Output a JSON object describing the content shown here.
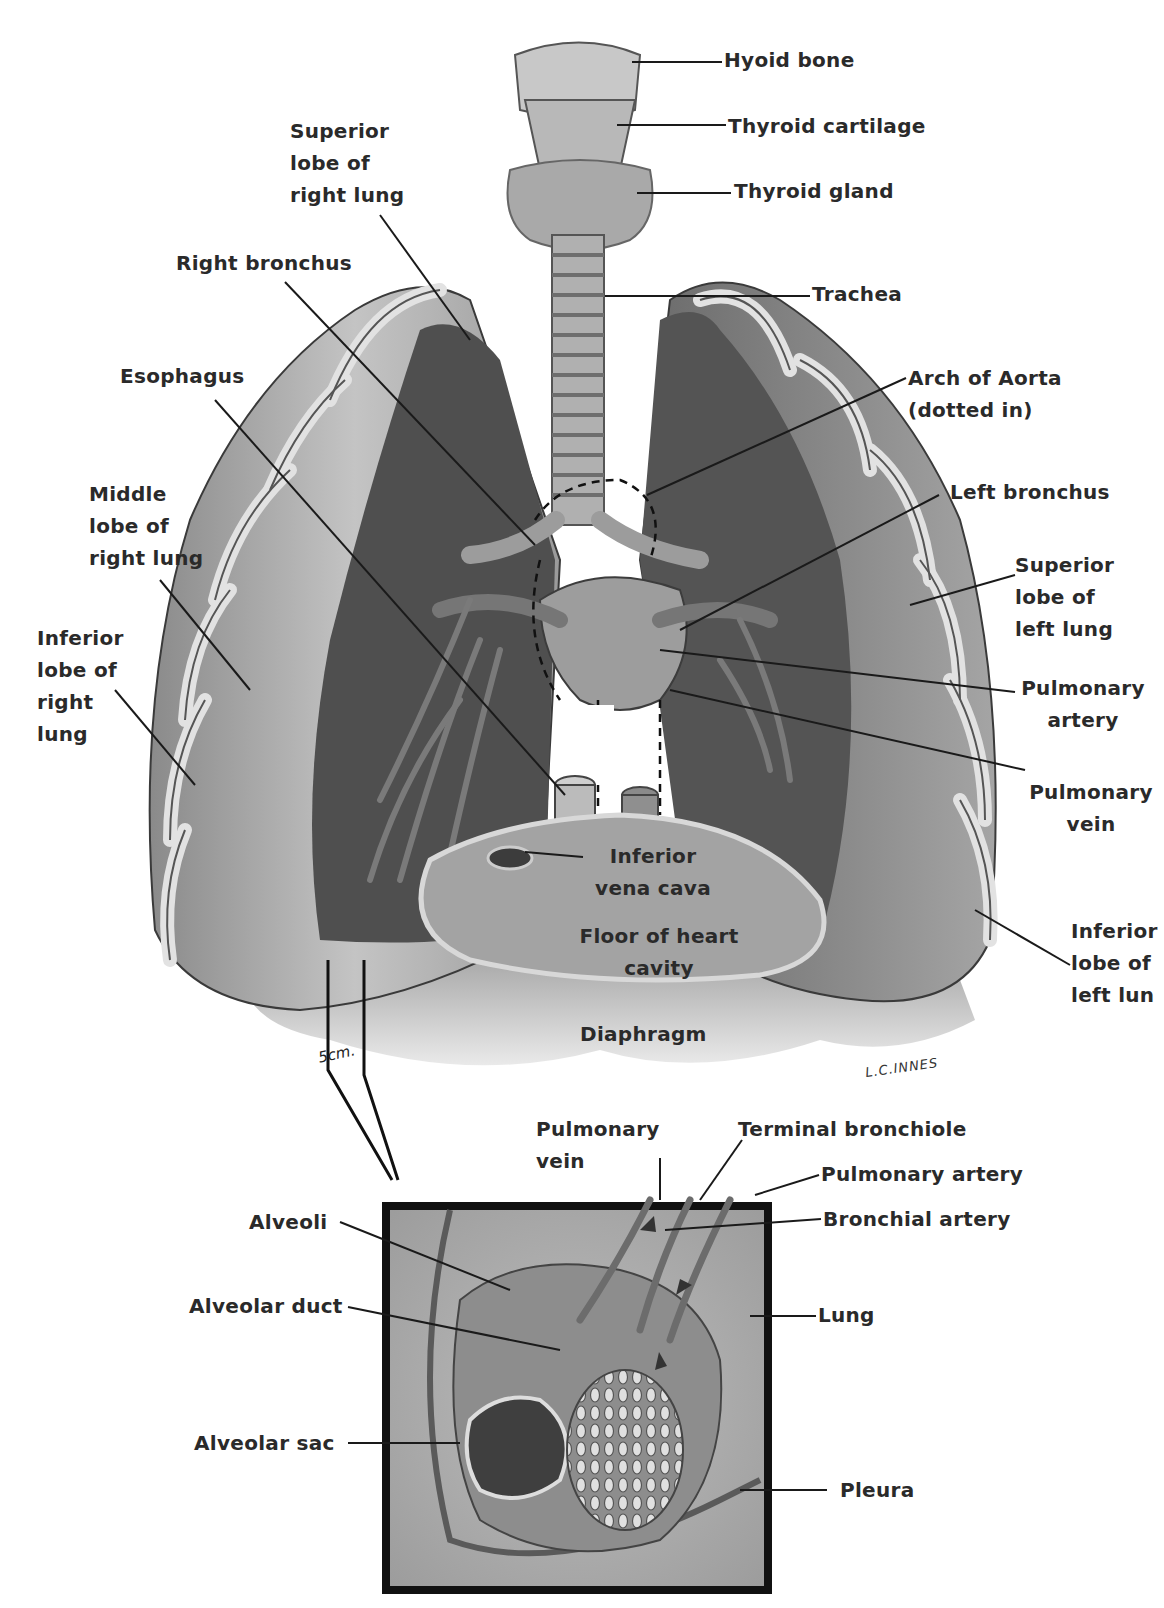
{
  "figure": {
    "colors": {
      "background": "#ffffff",
      "ink": "#2a2a2a",
      "lung_light": "#b9b9b9",
      "lung_dark": "#5e5e5e",
      "cavity": "#4a4a4a",
      "diaphragm": "#a8a8a8",
      "inset_border": "#111111"
    },
    "signature": "L.C.INNES",
    "scale_label": "5cm."
  },
  "main_labels": {
    "hyoid_bone": "Hyoid bone",
    "thyroid_cartilage": "Thyroid cartilage",
    "thyroid_gland": "Thyroid gland",
    "superior_lobe_right": "Superior\nlobe of\nright lung",
    "right_bronchus": "Right bronchus",
    "trachea": "Trachea",
    "esophagus": "Esophagus",
    "arch_of_aorta": "Arch of Aorta\n(dotted in)",
    "left_bronchus": "Left bronchus",
    "middle_lobe_right": "Middle\nlobe of\nright lung",
    "superior_lobe_left": "Superior\nlobe of\nleft lung",
    "inferior_lobe_right": "Inferior\nlobe of\nright\nlung",
    "pulmonary_artery": "Pulmonary\nartery",
    "pulmonary_vein": "Pulmonary\nvein",
    "inferior_vena_cava": "Inferior\nvena cava",
    "floor_heart_cavity": "Floor of heart\ncavity",
    "inferior_lobe_left": "Inferior\nlobe of\nleft lun",
    "diaphragm": "Diaphragm"
  },
  "inset_labels": {
    "pulmonary_vein": "Pulmonary\nvein",
    "terminal_bronchiole": "Terminal bronchiole",
    "pulmonary_artery": "Pulmonary artery",
    "bronchial_artery": "Bronchial artery",
    "alveoli": "Alveoli",
    "alveolar_duct": "Alveolar duct",
    "lung": "Lung",
    "alveolar_sac": "Alveolar sac",
    "pleura": "Pleura"
  }
}
